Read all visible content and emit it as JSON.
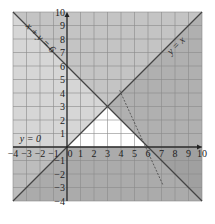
{
  "chart_data": {
    "type": "region",
    "title": "",
    "xlabel": "",
    "ylabel": "",
    "xlim": [
      -4,
      10
    ],
    "ylim": [
      -4,
      10
    ],
    "grid": true,
    "x_ticks": [
      -4,
      -3,
      -2,
      -1,
      0,
      1,
      2,
      3,
      4,
      5,
      6,
      7,
      8,
      9,
      10
    ],
    "y_ticks": [
      -4,
      -3,
      -2,
      -1,
      1,
      2,
      3,
      4,
      5,
      6,
      7,
      8,
      9,
      10
    ],
    "x_tick_labels": [
      "-4",
      "-3",
      "-2",
      "-1",
      "0",
      "1",
      "2",
      "3",
      "4",
      "5",
      "6",
      "7",
      "8",
      "9",
      "10"
    ],
    "y_tick_labels": [
      "-4",
      "-3",
      "-2",
      "-1",
      "1",
      "2",
      "3",
      "4",
      "5",
      "6",
      "7",
      "8",
      "9",
      "10"
    ],
    "lines": [
      {
        "label": "x + y = 6",
        "style": "solid",
        "points": [
          [
            -4,
            10
          ],
          [
            10,
            -4
          ]
        ]
      },
      {
        "label": "y = x",
        "style": "solid",
        "points": [
          [
            -4,
            -4
          ],
          [
            10,
            10
          ]
        ]
      },
      {
        "label": "y = 0",
        "style": "solid",
        "points": [
          [
            -4,
            0
          ],
          [
            10,
            0
          ]
        ]
      },
      {
        "label": "",
        "style": "dashed",
        "points": [
          [
            3.9,
            4.2
          ],
          [
            7.1,
            -2.8
          ]
        ]
      }
    ],
    "shaded_regions": [
      {
        "description": "x + y > 6 (shaded out)",
        "color": "#bdbdbd"
      },
      {
        "description": "y > x (shaded out)",
        "color": "#d6d6d6"
      },
      {
        "description": "y < 0 (shaded out)",
        "color": "#bdbdbd"
      }
    ],
    "feasible_region": {
      "description": "unshaded triangle satisfying y >= 0, y <= x, x + y <= 6",
      "vertices": [
        [
          0,
          0
        ],
        [
          6,
          0
        ],
        [
          3,
          3
        ]
      ],
      "color": "#ffffff"
    }
  },
  "labels": {
    "line_xy6": "x + y = 6",
    "line_yx": "y = x",
    "line_y0": "y = 0"
  }
}
